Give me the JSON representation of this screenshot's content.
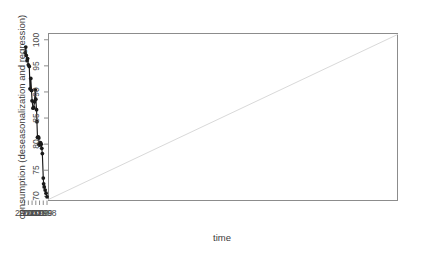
{
  "chart_data": {
    "type": "line",
    "title": "",
    "subtitle": "",
    "xlabel": "time",
    "ylabel": "consumption (deseasonalization and regression)",
    "xlim": [
      1997.6,
      1904.1
    ],
    "ylim": [
      69.2,
      101.2
    ],
    "xticks": [
      1998,
      1999,
      2000,
      2001,
      2002,
      2003,
      2004
    ],
    "xtick_labels": [
      "1998",
      "1999",
      "2000",
      "2001",
      "2002",
      "2003",
      "2004"
    ],
    "yticks": [
      70,
      75,
      80,
      85,
      90,
      95,
      100
    ],
    "ytick_labels": [
      "70",
      "75",
      "80",
      "85",
      "90",
      "95",
      "100"
    ],
    "grid": false,
    "legend": null,
    "frame": true,
    "series": [
      {
        "name": "consumption (deseasonalized)",
        "style": "line-with-points",
        "color": "#1a1a1a",
        "marker": "filled-circle",
        "x": [
          1998.0,
          1998.25,
          1998.5,
          1998.75,
          1998.9,
          1999.0,
          1999.25,
          1999.4,
          1999.55,
          1999.75,
          2000.0,
          2000.15,
          2000.2,
          2000.35,
          2000.55,
          2000.7,
          2000.8,
          2001.0,
          2001.15,
          2001.35,
          2001.55,
          2001.75,
          2002.0,
          2002.15,
          2002.35,
          2002.55,
          2002.75,
          2003.0,
          2003.2,
          2003.35,
          2003.55,
          2003.7,
          2003.85
        ],
        "y": [
          69.9,
          70.6,
          71.2,
          71.8,
          72.4,
          73.5,
          78.2,
          79.2,
          80.0,
          80.3,
          79.8,
          80.0,
          81.2,
          81.4,
          81.3,
          84.3,
          86.6,
          88.6,
          90.4,
          88.1,
          87.0,
          86.9,
          88.3,
          90.3,
          92.6,
          90.6,
          94.9,
          95.2,
          96.4,
          96.0,
          97.0,
          98.6,
          97.5
        ]
      },
      {
        "name": "linear regression trend",
        "style": "line",
        "color": "#d9d9d9",
        "marker": "none",
        "x": [
          1997.6,
          1904.1
        ],
        "y": [
          69.4,
          101.0
        ]
      }
    ]
  },
  "axes": {
    "x_title": "time",
    "y_title": "consumption (deseasonalization and regression)"
  }
}
